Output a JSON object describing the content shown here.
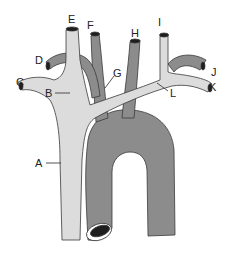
{
  "diagram": {
    "type": "anatomical-illustration",
    "colors": {
      "background": "#ffffff",
      "vein_fill": "#dcdcdc",
      "artery_fill": "#8c8c8c",
      "outline": "#3a3a3a",
      "lumen": "#1e1e1e"
    },
    "labels": [
      {
        "id": "A",
        "text": "A"
      },
      {
        "id": "B",
        "text": "B"
      },
      {
        "id": "C",
        "text": "C"
      },
      {
        "id": "D",
        "text": "D"
      },
      {
        "id": "E",
        "text": "E"
      },
      {
        "id": "F",
        "text": "F"
      },
      {
        "id": "G",
        "text": "G"
      },
      {
        "id": "H",
        "text": "H"
      },
      {
        "id": "I",
        "text": "I"
      },
      {
        "id": "J",
        "text": "J"
      },
      {
        "id": "K",
        "text": "K"
      },
      {
        "id": "L",
        "text": "L"
      }
    ]
  }
}
